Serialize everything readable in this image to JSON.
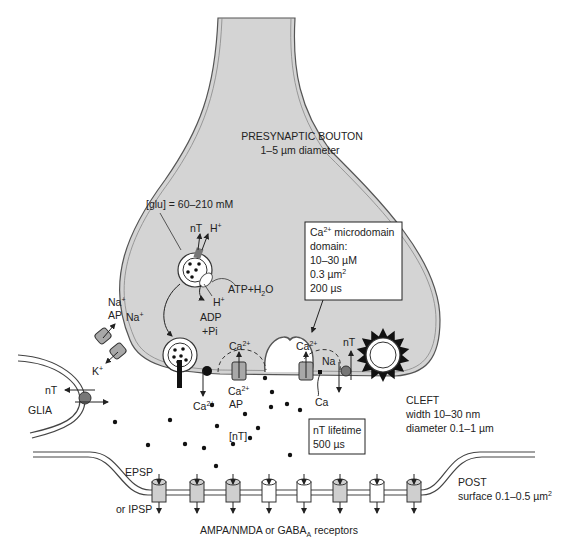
{
  "colors": {
    "bouton_fill": "#d4d4d4",
    "membrane_stroke": "#555555",
    "vesicle_fill": "#ffffff",
    "channel_fill": "#a8a8a8",
    "dot": "#111111",
    "transporter": "#777777"
  },
  "labels": {
    "bouton_title": "PRESYNAPTIC BOUTON",
    "bouton_size": "1–5 µm diameter",
    "glu": "[glu] = 60–210 mM",
    "nT_top": "nT",
    "H_top": "H",
    "H_sup": "+",
    "atp": "ATP+H",
    "atp_sub": "2",
    "atp_o": "O",
    "h_below": "H",
    "adp": "ADP",
    "pi": "+Pi",
    "na_ap1": "Na",
    "ap": "AP",
    "na2": "Na",
    "k": "K",
    "plus": "+",
    "glia_nT": "nT",
    "glia": "GLIA",
    "ca_release": "Ca",
    "ca_sup": "2+",
    "ca_dome1": "Ca",
    "ca_dome2": "Ca",
    "ca_ap": "Ca",
    "ap2": "AP",
    "na_exch": "Na",
    "ca_exch": "Ca",
    "nT_right": "nT",
    "nT_conc": "[nT]",
    "cleft_title": "CLEFT",
    "cleft_width": "width 10–30 nm",
    "cleft_diam": "diameter 0.1–1 µm",
    "epsp": "EPSP",
    "ipsp": "or IPSP",
    "post_title": "POST",
    "post_surface": "surface 0.1–0.5 µm",
    "post_sup": "2",
    "receptors": "AMPA/NMDA or GABA",
    "receptors_sub": "A",
    "receptors_end": " receptors"
  },
  "microdomain_box": {
    "line1_a": "Ca",
    "line1_sup": "2+",
    "line1_b": " microdomain",
    "line2": "domain:",
    "line3": "10–30 µM",
    "line4": "0.3 µm",
    "line4_sup": "2",
    "line5": "200 µs"
  },
  "lifetime_box": {
    "line1": "nT lifetime",
    "line2": "500 µs"
  },
  "receptors": [
    {
      "type": "shaded"
    },
    {
      "type": "shaded"
    },
    {
      "type": "shaded"
    },
    {
      "type": "open"
    },
    {
      "type": "open"
    },
    {
      "type": "shaded"
    },
    {
      "type": "open"
    },
    {
      "type": "shaded"
    }
  ]
}
